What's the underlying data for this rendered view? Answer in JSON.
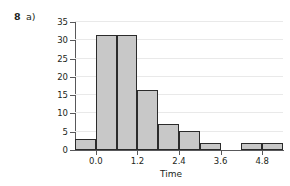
{
  "question": {
    "number": "8",
    "part": "a)"
  },
  "chart_data": {
    "type": "bar",
    "title": "",
    "xlabel": "Time",
    "ylabel": "Percentage",
    "grid": true,
    "legend": "none",
    "xlim": [
      -0.6,
      5.4
    ],
    "ylim": [
      0,
      35
    ],
    "ytick_labels": [
      "0",
      "5",
      "10",
      "15",
      "20",
      "25",
      "30",
      "35"
    ],
    "ytick_values": [
      0,
      5,
      10,
      15,
      20,
      25,
      30,
      35
    ],
    "xtick_labels": [
      "0.0",
      "1.2",
      "2.4",
      "3.6",
      "4.8"
    ],
    "xtick_values": [
      0.0,
      1.2,
      2.4,
      3.6,
      4.8
    ],
    "bin_width": 0.6,
    "bins": [
      {
        "left": -0.6,
        "right": 0.0,
        "value": 3.1
      },
      {
        "left": 0.0,
        "right": 0.6,
        "value": 31.5
      },
      {
        "left": 0.6,
        "right": 1.2,
        "value": 31.5
      },
      {
        "left": 1.2,
        "right": 1.8,
        "value": 16.5
      },
      {
        "left": 1.8,
        "right": 2.4,
        "value": 7.0
      },
      {
        "left": 2.4,
        "right": 3.0,
        "value": 5.3
      },
      {
        "left": 3.0,
        "right": 3.6,
        "value": 1.9
      },
      {
        "left": 3.6,
        "right": 4.2,
        "value": 0.0
      },
      {
        "left": 4.2,
        "right": 4.8,
        "value": 1.9
      },
      {
        "left": 4.8,
        "right": 5.4,
        "value": 1.9
      }
    ],
    "categories": [
      "-0.6",
      "0.0",
      "0.6",
      "1.2",
      "1.8",
      "2.4",
      "3.0",
      "3.6",
      "4.2",
      "4.8"
    ],
    "values": [
      3.1,
      31.5,
      31.5,
      16.5,
      7.0,
      5.3,
      1.9,
      0.0,
      1.9,
      1.9
    ],
    "colors": {
      "bar_fill": "#c8c8c8",
      "bar_stroke": "#2b2b2b",
      "axis": "#58585a",
      "grid": "#e9e9e9",
      "text": "#231f20",
      "background": "#ffffff"
    }
  }
}
